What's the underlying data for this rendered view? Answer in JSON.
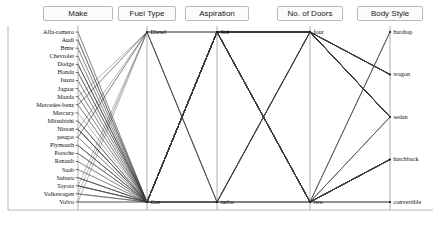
{
  "chart_data": {
    "type": "line",
    "title": "",
    "subtitle": "",
    "xlabel": "",
    "ylabel": "",
    "grid": false,
    "legend_position": "none",
    "plot_style": "parallel-coordinates",
    "axes": [
      {
        "name": "Make",
        "header": "Make",
        "label_side": "left",
        "categories": [
          "Alfa-romero",
          "Audi",
          "Bmw",
          "Chevrolet",
          "Dodge",
          "Honda",
          "Isuzu",
          "Jaguar",
          "Mazda",
          "Mercedes-benz",
          "Mercury",
          "Mitsubishi",
          "Nissan",
          "peugot",
          "Plymouth",
          "Porsche",
          "Renault",
          "Saab",
          "Subaru",
          "Toyota",
          "Volkswagen",
          "Volvo"
        ]
      },
      {
        "name": "Fuel Type",
        "header": "Fuel Type",
        "label_side": "right",
        "categories": [
          "Diesel",
          "Gas"
        ]
      },
      {
        "name": "Aspiration",
        "header": "Aspiration",
        "label_side": "right",
        "categories": [
          "Std",
          "turbo"
        ]
      },
      {
        "name": "No. of Doors",
        "header": "No. of Doors",
        "label_side": "right",
        "categories": [
          "four",
          "two"
        ]
      },
      {
        "name": "Body Style",
        "header": "Body Style",
        "label_side": "right",
        "categories": [
          "hardtop",
          "wagon",
          "sedan",
          "hatchback",
          "convertible"
        ]
      }
    ],
    "records": [
      {
        "make": "Alfa-romero",
        "fuel": "Gas",
        "aspiration": "Std",
        "doors": "two",
        "body": "convertible"
      },
      {
        "make": "Alfa-romero",
        "fuel": "Gas",
        "aspiration": "Std",
        "doors": "two",
        "body": "hatchback"
      },
      {
        "make": "Audi",
        "fuel": "Gas",
        "aspiration": "Std",
        "doors": "four",
        "body": "sedan"
      },
      {
        "make": "Audi",
        "fuel": "Gas",
        "aspiration": "turbo",
        "doors": "four",
        "body": "sedan"
      },
      {
        "make": "Audi",
        "fuel": "Gas",
        "aspiration": "Std",
        "doors": "two",
        "body": "hatchback"
      },
      {
        "make": "Bmw",
        "fuel": "Gas",
        "aspiration": "Std",
        "doors": "two",
        "body": "sedan"
      },
      {
        "make": "Bmw",
        "fuel": "Gas",
        "aspiration": "Std",
        "doors": "four",
        "body": "sedan"
      },
      {
        "make": "Chevrolet",
        "fuel": "Gas",
        "aspiration": "Std",
        "doors": "two",
        "body": "hatchback"
      },
      {
        "make": "Chevrolet",
        "fuel": "Gas",
        "aspiration": "Std",
        "doors": "four",
        "body": "sedan"
      },
      {
        "make": "Dodge",
        "fuel": "Gas",
        "aspiration": "Std",
        "doors": "two",
        "body": "hatchback"
      },
      {
        "make": "Dodge",
        "fuel": "Gas",
        "aspiration": "turbo",
        "doors": "two",
        "body": "hatchback"
      },
      {
        "make": "Dodge",
        "fuel": "Gas",
        "aspiration": "Std",
        "doors": "four",
        "body": "sedan"
      },
      {
        "make": "Dodge",
        "fuel": "Gas",
        "aspiration": "Std",
        "doors": "four",
        "body": "wagon"
      },
      {
        "make": "Honda",
        "fuel": "Gas",
        "aspiration": "Std",
        "doors": "two",
        "body": "hatchback"
      },
      {
        "make": "Honda",
        "fuel": "Gas",
        "aspiration": "Std",
        "doors": "four",
        "body": "sedan"
      },
      {
        "make": "Honda",
        "fuel": "Gas",
        "aspiration": "Std",
        "doors": "four",
        "body": "wagon"
      },
      {
        "make": "Isuzu",
        "fuel": "Gas",
        "aspiration": "Std",
        "doors": "four",
        "body": "sedan"
      },
      {
        "make": "Isuzu",
        "fuel": "Gas",
        "aspiration": "Std",
        "doors": "two",
        "body": "hatchback"
      },
      {
        "make": "Jaguar",
        "fuel": "Gas",
        "aspiration": "Std",
        "doors": "four",
        "body": "sedan"
      },
      {
        "make": "Jaguar",
        "fuel": "Gas",
        "aspiration": "Std",
        "doors": "two",
        "body": "sedan"
      },
      {
        "make": "Mazda",
        "fuel": "Gas",
        "aspiration": "Std",
        "doors": "two",
        "body": "hatchback"
      },
      {
        "make": "Mazda",
        "fuel": "Diesel",
        "aspiration": "Std",
        "doors": "four",
        "body": "sedan"
      },
      {
        "make": "Mazda",
        "fuel": "Gas",
        "aspiration": "Std",
        "doors": "four",
        "body": "sedan"
      },
      {
        "make": "Mercedes-benz",
        "fuel": "Diesel",
        "aspiration": "turbo",
        "doors": "four",
        "body": "sedan"
      },
      {
        "make": "Mercedes-benz",
        "fuel": "Gas",
        "aspiration": "Std",
        "doors": "two",
        "body": "hardtop"
      },
      {
        "make": "Mercedes-benz",
        "fuel": "Diesel",
        "aspiration": "turbo",
        "doors": "four",
        "body": "wagon"
      },
      {
        "make": "Mercedes-benz",
        "fuel": "Gas",
        "aspiration": "Std",
        "doors": "two",
        "body": "convertible"
      },
      {
        "make": "Mercury",
        "fuel": "Gas",
        "aspiration": "turbo",
        "doors": "two",
        "body": "hatchback"
      },
      {
        "make": "Mitsubishi",
        "fuel": "Gas",
        "aspiration": "Std",
        "doors": "two",
        "body": "hatchback"
      },
      {
        "make": "Mitsubishi",
        "fuel": "Gas",
        "aspiration": "turbo",
        "doors": "two",
        "body": "hatchback"
      },
      {
        "make": "Mitsubishi",
        "fuel": "Gas",
        "aspiration": "Std",
        "doors": "four",
        "body": "sedan"
      },
      {
        "make": "Nissan",
        "fuel": "Gas",
        "aspiration": "Std",
        "doors": "two",
        "body": "sedan"
      },
      {
        "make": "Nissan",
        "fuel": "Diesel",
        "aspiration": "Std",
        "doors": "two",
        "body": "sedan"
      },
      {
        "make": "Nissan",
        "fuel": "Gas",
        "aspiration": "Std",
        "doors": "four",
        "body": "sedan"
      },
      {
        "make": "Nissan",
        "fuel": "Gas",
        "aspiration": "Std",
        "doors": "four",
        "body": "wagon"
      },
      {
        "make": "Nissan",
        "fuel": "Gas",
        "aspiration": "Std",
        "doors": "two",
        "body": "hatchback"
      },
      {
        "make": "Nissan",
        "fuel": "Gas",
        "aspiration": "Std",
        "doors": "two",
        "body": "hardtop"
      },
      {
        "make": "peugot",
        "fuel": "Gas",
        "aspiration": "Std",
        "doors": "four",
        "body": "sedan"
      },
      {
        "make": "peugot",
        "fuel": "Diesel",
        "aspiration": "turbo",
        "doors": "four",
        "body": "sedan"
      },
      {
        "make": "peugot",
        "fuel": "Gas",
        "aspiration": "Std",
        "doors": "four",
        "body": "wagon"
      },
      {
        "make": "peugot",
        "fuel": "Diesel",
        "aspiration": "turbo",
        "doors": "four",
        "body": "wagon"
      },
      {
        "make": "Plymouth",
        "fuel": "Gas",
        "aspiration": "Std",
        "doors": "two",
        "body": "hatchback"
      },
      {
        "make": "Plymouth",
        "fuel": "Gas",
        "aspiration": "turbo",
        "doors": "two",
        "body": "hatchback"
      },
      {
        "make": "Plymouth",
        "fuel": "Gas",
        "aspiration": "Std",
        "doors": "four",
        "body": "sedan"
      },
      {
        "make": "Plymouth",
        "fuel": "Gas",
        "aspiration": "Std",
        "doors": "four",
        "body": "wagon"
      },
      {
        "make": "Porsche",
        "fuel": "Gas",
        "aspiration": "Std",
        "doors": "two",
        "body": "hardtop"
      },
      {
        "make": "Porsche",
        "fuel": "Gas",
        "aspiration": "Std",
        "doors": "two",
        "body": "convertible"
      },
      {
        "make": "Porsche",
        "fuel": "Gas",
        "aspiration": "Std",
        "doors": "two",
        "body": "hatchback"
      },
      {
        "make": "Renault",
        "fuel": "Gas",
        "aspiration": "Std",
        "doors": "four",
        "body": "wagon"
      },
      {
        "make": "Renault",
        "fuel": "Gas",
        "aspiration": "Std",
        "doors": "two",
        "body": "hatchback"
      },
      {
        "make": "Saab",
        "fuel": "Gas",
        "aspiration": "Std",
        "doors": "two",
        "body": "hatchback"
      },
      {
        "make": "Saab",
        "fuel": "Gas",
        "aspiration": "turbo",
        "doors": "four",
        "body": "sedan"
      },
      {
        "make": "Subaru",
        "fuel": "Gas",
        "aspiration": "Std",
        "doors": "two",
        "body": "hatchback"
      },
      {
        "make": "Subaru",
        "fuel": "Gas",
        "aspiration": "Std",
        "doors": "four",
        "body": "sedan"
      },
      {
        "make": "Subaru",
        "fuel": "Gas",
        "aspiration": "turbo",
        "doors": "four",
        "body": "wagon"
      },
      {
        "make": "Subaru",
        "fuel": "Gas",
        "aspiration": "Std",
        "doors": "four",
        "body": "wagon"
      },
      {
        "make": "Toyota",
        "fuel": "Gas",
        "aspiration": "Std",
        "doors": "two",
        "body": "hatchback"
      },
      {
        "make": "Toyota",
        "fuel": "Diesel",
        "aspiration": "Std",
        "doors": "four",
        "body": "sedan"
      },
      {
        "make": "Toyota",
        "fuel": "Gas",
        "aspiration": "Std",
        "doors": "four",
        "body": "sedan"
      },
      {
        "make": "Toyota",
        "fuel": "Gas",
        "aspiration": "Std",
        "doors": "four",
        "body": "wagon"
      },
      {
        "make": "Toyota",
        "fuel": "Gas",
        "aspiration": "Std",
        "doors": "two",
        "body": "hardtop"
      },
      {
        "make": "Toyota",
        "fuel": "Gas",
        "aspiration": "turbo",
        "doors": "two",
        "body": "hatchback"
      },
      {
        "make": "Volkswagen",
        "fuel": "Diesel",
        "aspiration": "Std",
        "doors": "four",
        "body": "sedan"
      },
      {
        "make": "Volkswagen",
        "fuel": "Gas",
        "aspiration": "Std",
        "doors": "four",
        "body": "sedan"
      },
      {
        "make": "Volkswagen",
        "fuel": "Gas",
        "aspiration": "Std",
        "doors": "two",
        "body": "convertible"
      },
      {
        "make": "Volkswagen",
        "fuel": "Gas",
        "aspiration": "Std",
        "doors": "four",
        "body": "wagon"
      },
      {
        "make": "Volvo",
        "fuel": "Gas",
        "aspiration": "Std",
        "doors": "four",
        "body": "sedan"
      },
      {
        "make": "Volvo",
        "fuel": "Gas",
        "aspiration": "turbo",
        "doors": "four",
        "body": "sedan"
      },
      {
        "make": "Volvo",
        "fuel": "Diesel",
        "aspiration": "turbo",
        "doors": "four",
        "body": "sedan"
      },
      {
        "make": "Volvo",
        "fuel": "Gas",
        "aspiration": "Std",
        "doors": "four",
        "body": "wagon"
      }
    ],
    "colors": {
      "line": "#3a3a3a",
      "axis": "#8a8a8a",
      "frame": "#9a9a9a",
      "header_bg": "#fbfbfb",
      "header_border": "#b9b9b9",
      "text": "#111111"
    }
  }
}
